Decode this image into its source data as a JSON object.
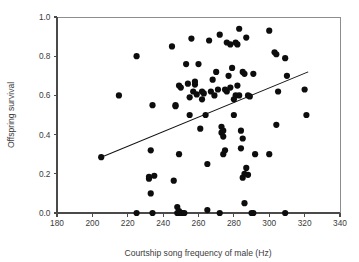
{
  "chart_data": {
    "type": "scatter",
    "title": "",
    "xlabel": "Courtship song frequency of male (Hz)",
    "ylabel": "Offspring survival",
    "xlim": [
      180,
      340
    ],
    "ylim": [
      0.0,
      1.0
    ],
    "xticks": [
      180,
      200,
      220,
      240,
      260,
      280,
      300,
      320,
      340
    ],
    "xtick_labels": [
      "180",
      "200",
      "220",
      "240",
      "260",
      "280",
      "300",
      "320",
      "340"
    ],
    "yticks": [
      0.0,
      0.2,
      0.4,
      0.6,
      0.8,
      1.0
    ],
    "ytick_labels": [
      "0.0",
      "0.2",
      "0.4",
      "0.6",
      "0.8",
      "1.0"
    ],
    "grid": false,
    "legend": null,
    "marker": "filled-circle",
    "marker_color": "#0d0d0d",
    "marker_size_px": 3.1,
    "x": [
      205,
      215,
      225,
      225,
      232,
      232,
      233,
      233,
      234,
      234,
      235,
      245,
      246,
      247,
      247,
      248,
      248,
      249,
      249,
      249,
      249,
      250,
      250,
      251,
      252,
      253,
      254,
      255,
      255,
      256,
      257,
      258,
      258,
      259,
      260,
      261,
      262,
      262,
      263,
      264,
      265,
      265,
      266,
      267,
      268,
      269,
      270,
      271,
      272,
      272,
      273,
      273,
      274,
      274,
      274,
      275,
      275,
      276,
      276,
      277,
      278,
      278,
      279,
      280,
      280,
      281,
      281,
      282,
      282,
      283,
      283,
      284,
      284,
      285,
      285,
      285,
      286,
      286,
      286,
      287,
      287,
      288,
      288,
      289,
      290,
      291,
      291,
      292,
      300,
      300,
      303,
      304,
      304,
      305,
      309,
      309,
      310,
      320,
      321
    ],
    "y": [
      0.285,
      0.6,
      0.8,
      0.0,
      0.175,
      0.185,
      0.32,
      0.1,
      0.55,
      0.0,
      0.19,
      0.85,
      0.165,
      0.545,
      0.55,
      0.0,
      0.03,
      0.0,
      0.01,
      0.3,
      0.65,
      0.0,
      0.64,
      0.0,
      0.0,
      0.76,
      0.66,
      0.59,
      0.5,
      0.89,
      0.62,
      0.655,
      0.67,
      0.605,
      0.76,
      0.43,
      0.58,
      0.62,
      0.61,
      0.5,
      0.25,
      0.015,
      0.88,
      0.62,
      0.68,
      0.6,
      0.72,
      0.63,
      0.91,
      0.0,
      0.44,
      0.41,
      0.39,
      0.42,
      0.3,
      0.32,
      0.63,
      0.87,
      0.62,
      0.7,
      0.86,
      0.64,
      0.74,
      0.5,
      0.58,
      0.87,
      0.6,
      0.65,
      0.86,
      0.94,
      0.6,
      0.42,
      0.33,
      0.72,
      0.38,
      0.18,
      0.71,
      0.2,
      0.05,
      0.895,
      0.23,
      0.195,
      0.6,
      0.595,
      0.0,
      0.0,
      0.71,
      0.3,
      0.93,
      0.3,
      0.82,
      0.81,
      0.45,
      0.62,
      0.79,
      0.0,
      0.7,
      0.63,
      0.5
    ],
    "fit_line": {
      "type": "linear-regression",
      "x_start": 205,
      "y_start": 0.285,
      "x_end": 322,
      "y_end": 0.72
    }
  },
  "axes": {
    "y_title": "Offspring survival",
    "x_title": "Courtship song frequency of male (Hz)"
  }
}
